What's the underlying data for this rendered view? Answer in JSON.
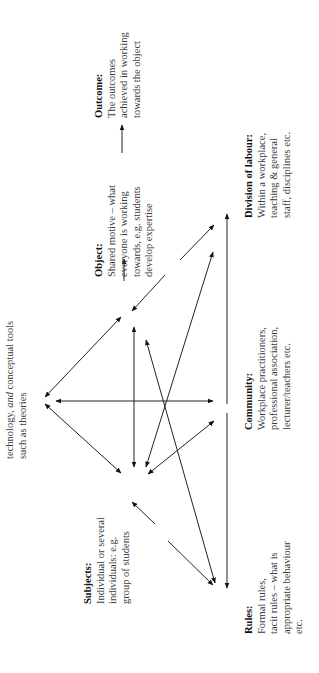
{
  "diagram": {
    "type": "activity-system-triangle",
    "orientation": "rotated -90deg",
    "nodes": {
      "tools": {
        "lines": [
          "technology, and conceptual tools",
          "such as theories"
        ],
        "italic_word": "and"
      },
      "subjects": {
        "title": "Subjects:",
        "lines": [
          "Individual or several",
          "individuals: e.g.",
          "group of students"
        ]
      },
      "object": {
        "title": "Object:",
        "lines": [
          "Shared motive – what",
          "everyone is working",
          "towards, e.g. students",
          "develop expertise"
        ]
      },
      "outcome": {
        "title": "Outcome:",
        "lines": [
          "The outcomes",
          "achieved in working",
          "towards the object"
        ]
      },
      "rules": {
        "title": "Rules:",
        "lines": [
          "Formal rules,",
          "tacit rules – what is",
          "appropriate behaviour",
          "etc."
        ]
      },
      "community": {
        "title": "Community:",
        "lines": [
          "Workplace practitioners,",
          "professional association,",
          "lecturer/teachers etc."
        ]
      },
      "division": {
        "title": "Division of labour:",
        "lines": [
          "Within a workplace,",
          "teaching & general",
          "staff, disciplines etc."
        ]
      }
    },
    "connections": [
      [
        "tools",
        "subjects"
      ],
      [
        "tools",
        "object"
      ],
      [
        "tools",
        "community"
      ],
      [
        "subjects",
        "object"
      ],
      [
        "subjects",
        "rules"
      ],
      [
        "subjects",
        "division"
      ],
      [
        "subjects",
        "community"
      ],
      [
        "object",
        "outcome"
      ],
      [
        "object",
        "division"
      ],
      [
        "object",
        "rules"
      ],
      [
        "rules",
        "community"
      ],
      [
        "community",
        "division"
      ]
    ]
  }
}
